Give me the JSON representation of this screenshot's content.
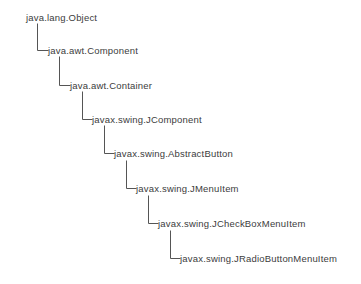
{
  "diagram": {
    "type": "class-inheritance-hierarchy",
    "title": "",
    "background_color": "#ffffff",
    "text_color": "#3c3c3c",
    "connector_color": "#555555",
    "connector_width": 1,
    "layout": "indented-staircase",
    "nodes": [
      {
        "id": "node-1",
        "label": "java.lang.Object",
        "depth": 0,
        "text_x": 26,
        "center_y": 17,
        "stem_x": 37,
        "has_incoming_elbow": false
      },
      {
        "id": "node-2",
        "label": "java.awt.Component",
        "depth": 1,
        "text_x": 48,
        "center_y": 50,
        "stem_x": 59,
        "has_incoming_elbow": true,
        "elbow_from_x": 37,
        "elbow_from_y": 24
      },
      {
        "id": "node-3",
        "label": "java.awt.Container",
        "depth": 2,
        "text_x": 70,
        "center_y": 85,
        "stem_x": 82,
        "has_incoming_elbow": true,
        "elbow_from_x": 59,
        "elbow_from_y": 57
      },
      {
        "id": "node-4",
        "label": "javax.swing.JComponent",
        "depth": 3,
        "text_x": 92,
        "center_y": 119,
        "stem_x": 104,
        "has_incoming_elbow": true,
        "elbow_from_x": 82,
        "elbow_from_y": 92
      },
      {
        "id": "node-5",
        "label": "javax.swing.AbstractButton",
        "depth": 4,
        "text_x": 114,
        "center_y": 153,
        "stem_x": 126,
        "has_incoming_elbow": true,
        "elbow_from_x": 104,
        "elbow_from_y": 126
      },
      {
        "id": "node-6",
        "label": "javax.swing.JMenuItem",
        "depth": 5,
        "text_x": 136,
        "center_y": 188,
        "stem_x": 148,
        "has_incoming_elbow": true,
        "elbow_from_x": 126,
        "elbow_from_y": 161
      },
      {
        "id": "node-7",
        "label": "javax.swing.JCheckBoxMenuItem",
        "depth": 6,
        "text_x": 158,
        "center_y": 223,
        "stem_x": 170,
        "has_incoming_elbow": true,
        "elbow_from_x": 148,
        "elbow_from_y": 196
      },
      {
        "id": "node-8",
        "label": "javax.swing.JRadioButtonMenuItem",
        "depth": 7,
        "text_x": 180,
        "center_y": 258,
        "stem_x": 192,
        "has_incoming_elbow": true,
        "elbow_from_x": 170,
        "elbow_from_y": 231
      }
    ],
    "edges": [
      {
        "id": "edge-1-2",
        "from": "java.lang.Object",
        "to": "java.awt.Component",
        "relation": "extends"
      },
      {
        "id": "edge-2-3",
        "from": "java.awt.Component",
        "to": "java.awt.Container",
        "relation": "extends"
      },
      {
        "id": "edge-3-4",
        "from": "java.awt.Container",
        "to": "javax.swing.JComponent",
        "relation": "extends"
      },
      {
        "id": "edge-4-5",
        "from": "javax.swing.JComponent",
        "to": "javax.swing.AbstractButton",
        "relation": "extends"
      },
      {
        "id": "edge-5-6",
        "from": "javax.swing.AbstractButton",
        "to": "javax.swing.JMenuItem",
        "relation": "extends"
      },
      {
        "id": "edge-6-7",
        "from": "javax.swing.JMenuItem",
        "to": "javax.swing.JCheckBoxMenuItem",
        "relation": "extends"
      },
      {
        "id": "edge-7-8",
        "from": "javax.swing.JCheckBoxMenuItem",
        "to": "javax.swing.JRadioButtonMenuItem",
        "relation": "extends"
      }
    ]
  }
}
